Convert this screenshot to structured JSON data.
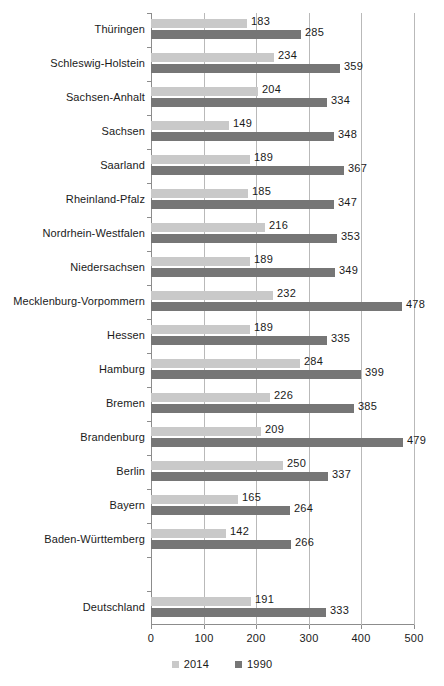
{
  "chart_data": {
    "type": "bar",
    "orientation": "horizontal",
    "title": "",
    "subtitle": "",
    "xlabel": "",
    "ylabel": "",
    "xlim": [
      0,
      500
    ],
    "xticks": [
      0,
      100,
      200,
      300,
      400,
      500
    ],
    "xtick_labels": [
      "0",
      "100",
      "200",
      "300",
      "400",
      "500"
    ],
    "grid": true,
    "grid_axis": "x",
    "legend_position": "bottom",
    "categories": [
      "Thüringen",
      "Schleswig-Holstein",
      "Sachsen-Anhalt",
      "Sachsen",
      "Saarland",
      "Rheinland-Pfalz",
      "Nordrhein-Westfalen",
      "Niedersachsen",
      "Mecklenburg-Vorpommern",
      "Hessen",
      "Hamburg",
      "Bremen",
      "Brandenburg",
      "Berlin",
      "Bayern",
      "Baden-Württemberg",
      "",
      "Deutschland"
    ],
    "series": [
      {
        "name": "2014",
        "color": "#c9c9c9",
        "values": [
          183,
          234,
          204,
          149,
          189,
          185,
          216,
          189,
          232,
          189,
          284,
          226,
          209,
          250,
          165,
          142,
          null,
          191
        ]
      },
      {
        "name": "1990",
        "color": "#767676",
        "values": [
          285,
          359,
          334,
          348,
          367,
          347,
          353,
          349,
          478,
          335,
          399,
          385,
          479,
          337,
          264,
          266,
          null,
          333
        ]
      }
    ]
  },
  "legend": {
    "items": [
      {
        "label": "2014",
        "color": "#c9c9c9"
      },
      {
        "label": "1990",
        "color": "#767676"
      }
    ]
  },
  "axis": {
    "x_tick_labels": [
      "0",
      "100",
      "200",
      "300",
      "400",
      "500"
    ]
  }
}
